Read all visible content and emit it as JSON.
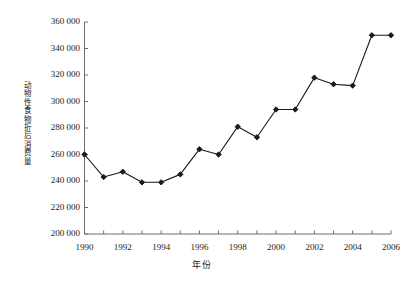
{
  "top_sliver": {
    "text": "·········  ·····   ·····    ·········   ·········    ···    ··"
  },
  "axis": {
    "y_title": "动物性食物折后消费量",
    "x_title": "年份",
    "y_ticks": [
      "200 000",
      "220 000",
      "240 000",
      "260 000",
      "280 000",
      "300 000",
      "320 000",
      "340 000",
      "360 000"
    ],
    "x_ticks": [
      "1990",
      "1992",
      "1994",
      "1996",
      "1998",
      "2000",
      "2002",
      "2004",
      "2006"
    ]
  },
  "style": {
    "line_color": "#1a1a1a",
    "marker_color": "#1a1a1a",
    "axis_color": "#6e6e6e",
    "background": "#ffffff"
  },
  "chart_data": {
    "type": "line",
    "title": "",
    "xlabel": "年份",
    "ylabel": "动物性食物折后消费量",
    "xlim": [
      1990,
      2006
    ],
    "ylim": [
      200000,
      360000
    ],
    "ytick_step": 20000,
    "xtick_step": 2,
    "grid": false,
    "legend": null,
    "marker": "diamond",
    "x": [
      1990,
      1991,
      1992,
      1993,
      1994,
      1995,
      1996,
      1997,
      1998,
      1999,
      2000,
      2001,
      2002,
      2003,
      2004,
      2005,
      2006
    ],
    "values": [
      260000,
      243000,
      247000,
      239000,
      239000,
      245000,
      264000,
      260000,
      281000,
      273000,
      294000,
      294000,
      318000,
      313000,
      312000,
      350000,
      350000
    ],
    "series": [
      {
        "name": "动物性食物折后消费量",
        "values": [
          260000,
          243000,
          247000,
          239000,
          239000,
          245000,
          264000,
          260000,
          281000,
          273000,
          294000,
          294000,
          318000,
          313000,
          312000,
          350000,
          350000
        ]
      }
    ]
  }
}
